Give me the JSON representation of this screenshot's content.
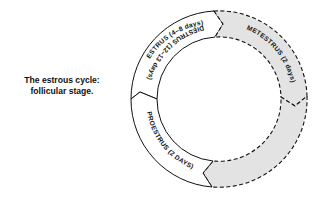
{
  "caption": {
    "line1": "The estrous cycle:",
    "line2": "follicular stage."
  },
  "diagram": {
    "type": "cycle-ring",
    "center": [
      219,
      99
    ],
    "outer_radius": 88,
    "inner_radius": 62,
    "direction": "clockwise",
    "colors": {
      "stroke": "#111111",
      "highlight_fill": "#e3e3e3",
      "plain_fill": "#ffffff"
    },
    "segments": [
      {
        "id": "estrus",
        "label": "ESTRUS (4–8 days)",
        "highlighted": false,
        "border": "solid"
      },
      {
        "id": "metestrus",
        "label": "METESTRUS (2 days)",
        "highlighted": true,
        "border": "dashed"
      },
      {
        "id": "diestrus",
        "label": "DIESTRUS (12–13 days)",
        "highlighted": true,
        "border": "dashed"
      },
      {
        "id": "proestrus",
        "label": "PROESTRUS (2 DAYS)",
        "highlighted": false,
        "border": "solid"
      }
    ]
  }
}
